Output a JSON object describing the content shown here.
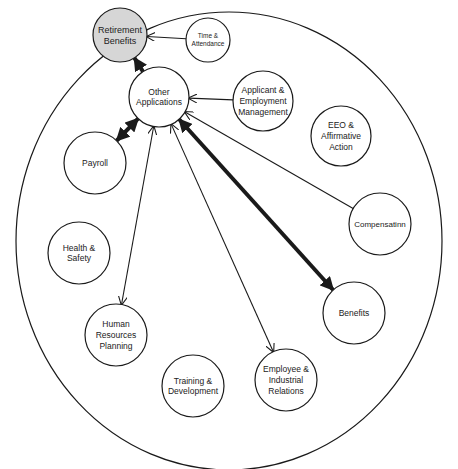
{
  "diagram": {
    "type": "hub-and-spoke system diagram",
    "boundary": "outer-ellipse",
    "nodes": [
      {
        "id": "retirement",
        "lines": [
          "Retirement",
          "Benefits"
        ],
        "cx": 120,
        "cy": 35,
        "r": 27,
        "fill": "#d6d6d6",
        "fs": 9
      },
      {
        "id": "time",
        "lines": [
          "Time &",
          "Attendance"
        ],
        "cx": 208,
        "cy": 40,
        "r": 22,
        "fill": "#ffffff",
        "fs": 6.5
      },
      {
        "id": "other",
        "lines": [
          "Other",
          "Applications"
        ],
        "cx": 159,
        "cy": 97,
        "r": 30,
        "fill": "#ffffff",
        "fs": 8.5
      },
      {
        "id": "applicant",
        "lines": [
          "Applicant &",
          "Employment",
          "Management"
        ],
        "cx": 263,
        "cy": 101,
        "r": 30,
        "fill": "#ffffff",
        "fs": 8.5
      },
      {
        "id": "eeo",
        "lines": [
          "EEO &",
          "Affirmative",
          "Action"
        ],
        "cx": 341,
        "cy": 136,
        "r": 30,
        "fill": "#ffffff",
        "fs": 8.5
      },
      {
        "id": "payroll",
        "lines": [
          "Payroll"
        ],
        "cx": 95,
        "cy": 163,
        "r": 31,
        "fill": "#ffffff",
        "fs": 8.5
      },
      {
        "id": "compensation",
        "lines": [
          "Compensatinn"
        ],
        "cx": 380,
        "cy": 224,
        "r": 31,
        "fill": "#ffffff",
        "fs": 8
      },
      {
        "id": "health",
        "lines": [
          "Health &",
          "Safety"
        ],
        "cx": 79,
        "cy": 253,
        "r": 31,
        "fill": "#ffffff",
        "fs": 8.5
      },
      {
        "id": "benefits",
        "lines": [
          "Benefits"
        ],
        "cx": 354,
        "cy": 313,
        "r": 31,
        "fill": "#ffffff",
        "fs": 8.5
      },
      {
        "id": "hrplanning",
        "lines": [
          "Human",
          "Resources",
          "Planning"
        ],
        "cx": 116,
        "cy": 335,
        "r": 31,
        "fill": "#ffffff",
        "fs": 8.5
      },
      {
        "id": "training",
        "lines": [
          "Training &",
          "Development"
        ],
        "cx": 193,
        "cy": 386,
        "r": 31,
        "fill": "#ffffff",
        "fs": 8.5
      },
      {
        "id": "employee",
        "lines": [
          "Employee &",
          "Industrial",
          "Relations"
        ],
        "cx": 286,
        "cy": 380,
        "r": 31,
        "fill": "#ffffff",
        "fs": 8.5
      }
    ],
    "edges": [
      {
        "from": "other",
        "to": "retirement",
        "weight": "thick",
        "direction": "to"
      },
      {
        "from": "time",
        "to": "retirement",
        "weight": "thin",
        "direction": "to"
      },
      {
        "from": "applicant",
        "to": "other",
        "weight": "thin",
        "direction": "to"
      },
      {
        "from": "other",
        "to": "payroll",
        "weight": "thick",
        "direction": "both"
      },
      {
        "from": "other",
        "to": "hrplanning",
        "weight": "thin",
        "direction": "both"
      },
      {
        "from": "other",
        "to": "employee",
        "weight": "thin",
        "direction": "both"
      },
      {
        "from": "other",
        "to": "benefits",
        "weight": "thick",
        "direction": "both"
      },
      {
        "from": "compensation",
        "to": "other",
        "weight": "thin",
        "direction": "to"
      }
    ],
    "colors": {
      "stroke": "#1a1a1a",
      "highlight_fill": "#d6d6d6",
      "background": "#ffffff"
    }
  }
}
